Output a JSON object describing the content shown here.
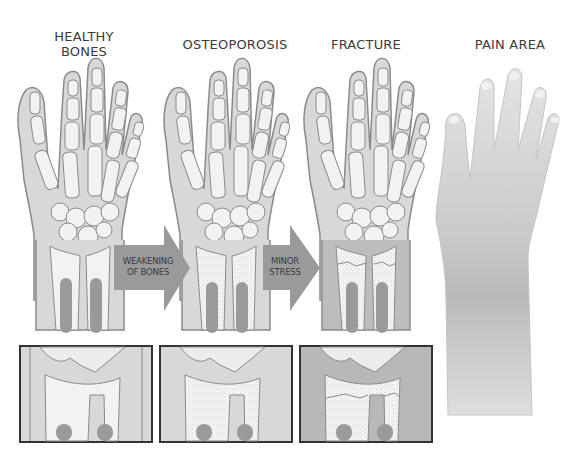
{
  "diagram": {
    "panels": [
      {
        "id": "healthy",
        "title_line1": "HEALTHY",
        "title_line2": "BONES"
      },
      {
        "id": "osteoporosis",
        "title_line1": "OSTEOPOROSIS"
      },
      {
        "id": "fracture",
        "title_line1": "FRACTURE"
      },
      {
        "id": "pain",
        "title_line1": "PAIN AREA"
      }
    ],
    "arrows": [
      {
        "line1": "WEAKENING",
        "line2": "OF BONES"
      },
      {
        "line1": "MINOR",
        "line2": "STRESS"
      }
    ],
    "detail_boxes": [
      {
        "id": "healthy-detail"
      },
      {
        "id": "osteoporosis-detail"
      },
      {
        "id": "fracture-detail"
      }
    ],
    "colors": {
      "background": "#ffffff",
      "bone_fill": "#f2f2f2",
      "soft_tissue": "#d6d6d6",
      "soft_tissue_dark": "#b8b8b8",
      "outline": "#8a8a8a",
      "marrow": "#9a9a9a",
      "arrow": "#9a9a9a",
      "box_border": "#333333",
      "skin": "#d0d0d0"
    }
  }
}
